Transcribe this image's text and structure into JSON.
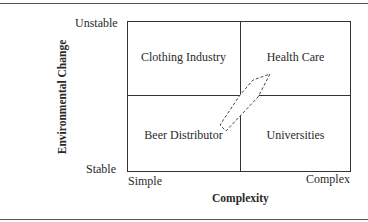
{
  "diagram": {
    "y_axis": {
      "label": "Environmental Change",
      "top": "Unstable",
      "bottom": "Stable"
    },
    "x_axis": {
      "label": "Complexity",
      "left": "Simple",
      "right": "Complex"
    },
    "quadrants": {
      "top_left": "Clothing Industry",
      "top_right": "Health Care",
      "bottom_left": "Beer Distributor",
      "bottom_right": "Universities"
    },
    "arrow": {
      "style": "dashed",
      "from": "Beer Distributor",
      "to": "Health Care"
    }
  }
}
